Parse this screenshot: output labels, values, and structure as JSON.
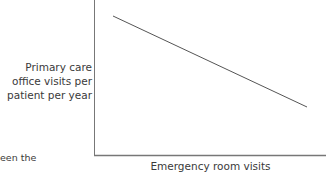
{
  "chart_data": {
    "type": "line",
    "title": "",
    "xlabel": "Emergency room visits",
    "ylabel": "Primary care office visits per patient per year",
    "ylabel_lines": [
      "Primary care",
      "office visits per",
      "patient per year"
    ],
    "x": [
      0.1,
      1.0
    ],
    "series": [
      {
        "name": "relationship",
        "values": [
          0.9,
          0.4
        ]
      }
    ],
    "xlim": [
      0,
      1
    ],
    "ylim": [
      0,
      1
    ],
    "grid": false,
    "legend": null,
    "tick_labels": {
      "x": [],
      "y": []
    },
    "annotations": [
      "een the",
      "te of",
      "atients"
    ]
  },
  "caption_fragment": [
    "een the",
    "te of",
    "atients"
  ],
  "colors": {
    "axis": "#777777",
    "line": "#555555",
    "text": "#3a3a3a"
  }
}
